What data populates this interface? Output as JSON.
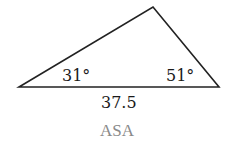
{
  "diagram": {
    "shape": "triangle",
    "vertices": [
      [
        19,
        87
      ],
      [
        153,
        7
      ],
      [
        219,
        87
      ]
    ],
    "stroke_color": "#222222",
    "angle_left": "31°",
    "angle_right": "51°",
    "side_bottom": "37.5",
    "caption": "ASA",
    "caption_color": "#8a8a8a"
  }
}
